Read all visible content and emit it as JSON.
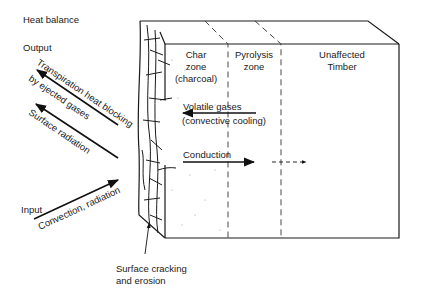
{
  "diagram": {
    "title": "Heat balance",
    "left_labels": {
      "output": "Output",
      "input": "Input"
    },
    "arrows": {
      "transpiration_line1": "Transpiration heat blocking",
      "transpiration_line2": "by ejected gases",
      "surface_radiation": "Surface radiation",
      "convection_radiation": "Convection, radiation",
      "volatile_line1": "Volatile gases",
      "volatile_line2": "(convective cooling)",
      "conduction": "Conduction"
    },
    "zones": [
      {
        "line1": "Char",
        "line2": "zone",
        "line3": "(charcoal)"
      },
      {
        "line1": "Pyrolysis",
        "line2": "zone"
      },
      {
        "line1": "Unaffected",
        "line2": "Timber"
      }
    ],
    "callout": {
      "line1": "Surface cracking",
      "line2": "and erosion"
    },
    "colors": {
      "ink": "#1a1a1a",
      "background": "#ffffff"
    }
  }
}
